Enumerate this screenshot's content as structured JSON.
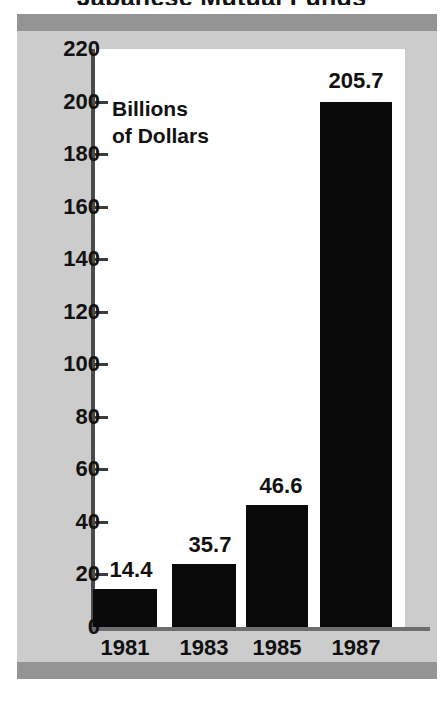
{
  "chart_data": {
    "type": "bar",
    "title": "Japanese Mutual Funds",
    "title_visible_fragment": "Japanese Mutual Funds",
    "subtitle": "",
    "xlabel": "",
    "ylabel": "Billions of Dollars",
    "ylabel_line1": "Billions",
    "ylabel_line2": "of Dollars",
    "categories": [
      "1981",
      "1983",
      "1985",
      "1987"
    ],
    "values": [
      14.4,
      35.7,
      46.6,
      205.7
    ],
    "data_labels": [
      "14.4",
      "35.7",
      "46.6",
      "205.7"
    ],
    "series": [
      {
        "name": "Assets",
        "values": [
          14.4,
          35.7,
          46.6,
          205.7
        ]
      }
    ],
    "ylim": [
      0,
      220
    ],
    "ytick_step": 20,
    "yticks": [
      0,
      20,
      40,
      60,
      80,
      100,
      120,
      140,
      160,
      180,
      200,
      220
    ],
    "ytick_labels": [
      "0",
      "20",
      "40",
      "60",
      "80",
      "100",
      "120",
      "140",
      "160",
      "180",
      "200",
      "220"
    ],
    "grid": false,
    "legend": false,
    "legend_position": "none",
    "bar_color": "#0a0a0a",
    "panel_color": "#cccccc",
    "band_color": "#949494",
    "plot_color": "#ffffff",
    "rendered_bar_heights_px": [
      38,
      63,
      122,
      525
    ],
    "rendered_bar_tops_px": [
      589,
      564,
      505,
      102
    ],
    "bars": [
      {
        "category": "1981",
        "value": 14.4,
        "label": "14.4",
        "x": 93,
        "width": 64,
        "top": 589,
        "height": 38,
        "label_x": 93,
        "label_y": 559
      },
      {
        "category": "1983",
        "value": 35.7,
        "label": "35.7",
        "x": 172,
        "width": 64,
        "top": 564,
        "height": 63,
        "label_x": 172,
        "label_y": 534
      },
      {
        "category": "1985",
        "value": 46.6,
        "label": "46.6",
        "x": 246,
        "width": 62,
        "top": 505,
        "height": 122,
        "label_x": 244,
        "label_y": 475
      },
      {
        "category": "1987",
        "value": 205.7,
        "label": "205.7",
        "x": 320,
        "width": 72,
        "top": 102,
        "height": 525,
        "label_x": 314,
        "label_y": 70
      }
    ]
  }
}
